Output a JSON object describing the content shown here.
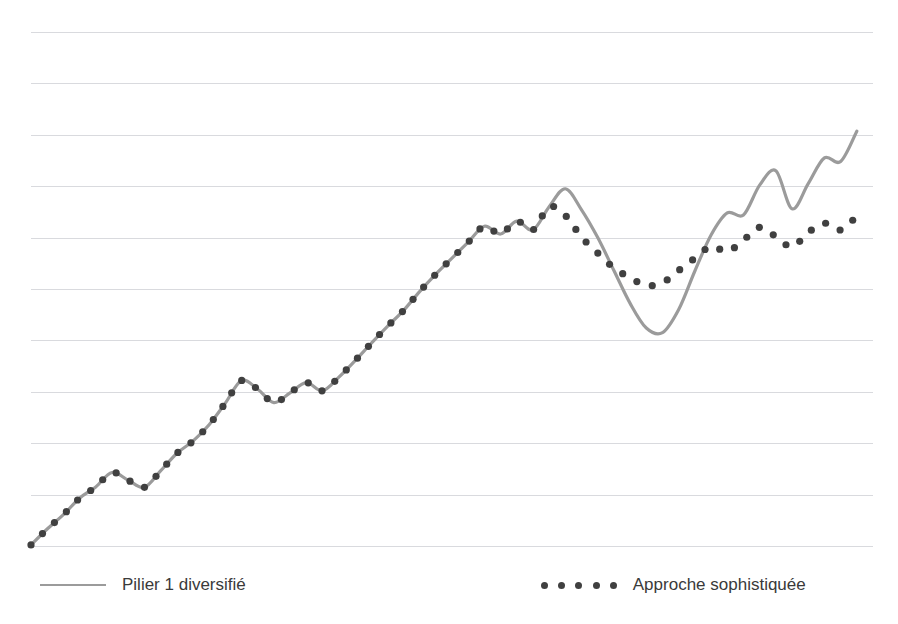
{
  "legend": {
    "position": "bottom",
    "entries": [
      {
        "label": "Pilier 1 diversifié",
        "marker": "solid-line",
        "color": "#9b9b9b"
      },
      {
        "label": "Approche sophistiquée",
        "marker": "dotted",
        "color": "#404040"
      }
    ]
  },
  "colors": {
    "line_series": "#9b9b9b",
    "dotted_series": "#404040",
    "gridline": "#d9dade",
    "background": "#ffffff"
  },
  "chart_data": {
    "type": "line",
    "title": "",
    "subtitle": "",
    "xlabel": "",
    "ylabel": "",
    "xlim": [
      0,
      52
    ],
    "ylim": [
      0,
      10
    ],
    "grid": true,
    "xticks": [],
    "yticks": [],
    "xticklabels": [],
    "yticklabels": [],
    "gridlines_y": [
      10,
      9,
      8,
      7,
      6,
      5,
      4,
      3,
      2,
      1,
      0
    ],
    "annotations": [],
    "x": [
      0,
      1,
      2,
      3,
      4,
      5,
      6,
      7,
      8,
      9,
      10,
      11,
      12,
      13,
      14,
      15,
      16,
      17,
      18,
      19,
      20,
      21,
      22,
      23,
      24,
      25,
      26,
      27,
      28,
      29,
      30,
      31,
      32,
      33,
      34,
      35,
      36,
      37,
      38,
      39,
      40,
      41,
      42,
      43,
      44,
      45,
      46,
      47,
      48,
      49,
      50,
      51
    ],
    "series": [
      {
        "name": "Pilier 1 diversifié",
        "marker": "solid-line",
        "color": "#9b9b9b",
        "values": [
          0.02,
          0.33,
          0.61,
          0.93,
          1.15,
          1.43,
          1.28,
          1.14,
          1.46,
          1.8,
          2.04,
          2.36,
          2.78,
          3.22,
          3.05,
          2.79,
          2.98,
          3.18,
          3.02,
          3.28,
          3.6,
          3.94,
          4.27,
          4.58,
          4.95,
          5.29,
          5.6,
          5.91,
          6.22,
          6.07,
          6.32,
          6.15,
          6.6,
          6.95,
          6.54,
          6.0,
          5.36,
          4.72,
          4.24,
          4.15,
          4.6,
          5.35,
          6.05,
          6.48,
          6.44,
          7.02,
          7.3,
          6.56,
          7.05,
          7.55,
          7.48,
          8.07
        ]
      },
      {
        "name": "Approche sophistiquée",
        "marker": "dotted",
        "color": "#404040",
        "values": [
          0.02,
          0.33,
          0.61,
          0.93,
          1.15,
          1.43,
          1.28,
          1.14,
          1.46,
          1.8,
          2.04,
          2.36,
          2.78,
          3.22,
          3.05,
          2.79,
          2.98,
          3.18,
          3.02,
          3.28,
          3.6,
          3.94,
          4.27,
          4.58,
          4.95,
          5.29,
          5.6,
          5.91,
          6.22,
          6.07,
          6.32,
          6.15,
          6.6,
          6.43,
          6.01,
          5.7,
          5.41,
          5.22,
          5.07,
          5.12,
          5.36,
          5.6,
          5.83,
          5.73,
          5.95,
          6.2,
          6.02,
          5.82,
          6.1,
          6.28,
          6.15,
          6.42
        ]
      }
    ]
  },
  "geometry": {
    "plot_left": 31,
    "plot_right": 873,
    "plot_top": 32,
    "plot_bottom": 546,
    "grid_rows": 10
  }
}
